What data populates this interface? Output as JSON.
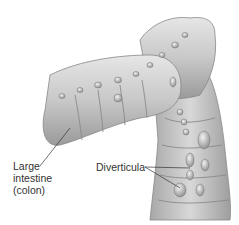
{
  "diagram": {
    "labels": {
      "colon_line1": "Large",
      "colon_line2": "intestine",
      "colon_line3": "(colon)",
      "diverticula": "Diverticula"
    },
    "colors": {
      "tissue_light": "#dcdcdc",
      "tissue_mid": "#b5b5b5",
      "tissue_dark": "#7a7a7a",
      "label_text": "#333333",
      "leader_line": "#333333"
    }
  }
}
